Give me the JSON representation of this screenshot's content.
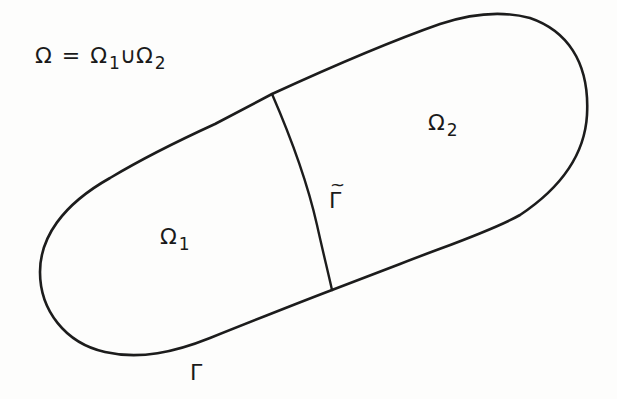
{
  "diagram": {
    "type": "domain-decomposition",
    "stroke_color": "#1c1c1c",
    "background_color": "#fdfdfc",
    "equation": {
      "lhs": "Ω",
      "equals": "=",
      "term1": "Ω",
      "term1_sub": "1",
      "union": "∪",
      "term2": "Ω",
      "term2_sub": "2"
    },
    "regions": [
      {
        "id": "omega1",
        "symbol": "Ω",
        "subscript": "1"
      },
      {
        "id": "omega2",
        "symbol": "Ω",
        "subscript": "2"
      }
    ],
    "interface": {
      "symbol": "Γ",
      "accent": "~"
    },
    "boundary": {
      "symbol": "Γ"
    }
  }
}
